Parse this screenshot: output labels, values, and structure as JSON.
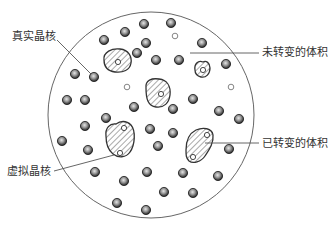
{
  "diagram": {
    "type": "nucleation-schematic",
    "colors": {
      "boundary": "#666666",
      "leader": "#555555",
      "outline": "#333333",
      "hatch": "#555555",
      "nucleus_dark": "#2a2a2a",
      "nucleus_light": "#cfcfcf"
    },
    "boundary_circle": {
      "cx": 151,
      "cy": 115,
      "r": 103
    },
    "labels": {
      "real_nucleus": "真实晶核",
      "untransformed_volume": "未转变的体积",
      "transformed_volume": "已转变的体积",
      "phantom_nucleus": "虚拟晶核"
    },
    "real_nuclei": [
      [
        144,
        24
      ],
      [
        171,
        23
      ],
      [
        125,
        32
      ],
      [
        104,
        40
      ],
      [
        146,
        43
      ],
      [
        202,
        43
      ],
      [
        137,
        53
      ],
      [
        156,
        60
      ],
      [
        179,
        60
      ],
      [
        226,
        64
      ],
      [
        75,
        74
      ],
      [
        94,
        77
      ],
      [
        67,
        100
      ],
      [
        85,
        100
      ],
      [
        134,
        107
      ],
      [
        193,
        99
      ],
      [
        173,
        109
      ],
      [
        219,
        111
      ],
      [
        239,
        119
      ],
      [
        106,
        118
      ],
      [
        85,
        126
      ],
      [
        150,
        129
      ],
      [
        173,
        133
      ],
      [
        62,
        141
      ],
      [
        88,
        150
      ],
      [
        158,
        146
      ],
      [
        229,
        149
      ],
      [
        95,
        172
      ],
      [
        147,
        172
      ],
      [
        183,
        173
      ],
      [
        218,
        176
      ],
      [
        124,
        181
      ],
      [
        164,
        192
      ],
      [
        193,
        193
      ],
      [
        117,
        203
      ],
      [
        146,
        210
      ]
    ],
    "open_points": [
      [
        175,
        36
      ],
      [
        127,
        87
      ],
      [
        231,
        87
      ]
    ],
    "transformed_regions": [
      {
        "name": "grain-upper-left",
        "path": "M104,60 C103,52 112,48 120,49 C129,50 132,57 131,63 C130,70 123,73 115,72 C107,71 104,66 104,60 Z",
        "centers": [
          [
            118,
            62
          ]
        ]
      },
      {
        "name": "grain-center",
        "path": "M146,88 C145,80 152,78 159,79 C167,80 171,86 170,95 C169,103 164,108 156,107 C148,106 146,99 146,88 Z",
        "centers": [
          [
            161,
            94
          ]
        ]
      },
      {
        "name": "grain-small-right",
        "path": "M195,70 C194,64 198,60 203,62 C206,60 210,63 210,68 C210,74 206,78 201,77 C197,76 195,74 195,70 Z",
        "centers": [
          [
            203,
            70
          ]
        ]
      },
      {
        "name": "grain-phantom-lower-left",
        "path": "M106,136 C105,128 110,123 116,124 C120,121 126,120 131,125 C136,131 135,145 130,152 C126,158 118,158 113,154 C108,150 106,143 106,136 Z",
        "centers": [
          [
            124,
            128
          ],
          [
            120,
            153
          ]
        ]
      },
      {
        "name": "grain-transformed-lower-right",
        "path": "M186,150 C186,140 190,133 196,130 C203,127 212,128 213,135 C214,143 209,150 205,156 C201,162 193,164 189,161 C186,158 186,155 186,150 Z",
        "centers": [
          [
            207,
            135
          ],
          [
            193,
            157
          ]
        ]
      }
    ],
    "leaders": [
      {
        "name": "leader-real-nucleus",
        "x1": 57,
        "y1": 40,
        "x2": 93,
        "y2": 76
      },
      {
        "name": "leader-untransformed",
        "x1": 190,
        "y1": 53,
        "x2": 259,
        "y2": 53
      },
      {
        "name": "leader-transformed",
        "x1": 205,
        "y1": 143,
        "x2": 259,
        "y2": 143
      },
      {
        "name": "leader-phantom",
        "x1": 54,
        "y1": 171,
        "x2": 114,
        "y2": 155
      }
    ]
  }
}
